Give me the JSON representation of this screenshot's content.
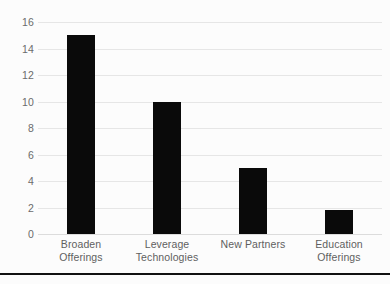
{
  "chart_data": {
    "type": "bar",
    "title": "",
    "subtitle": "",
    "xlabel": "",
    "ylabel": "",
    "categories": [
      "Broaden Offerings",
      "Leverage\nTechnologies",
      "New Partners",
      "Education\nOfferings"
    ],
    "values": [
      15,
      10,
      5,
      1.8
    ],
    "ylim": [
      0,
      16
    ],
    "ytick_step": 2,
    "ytick_labels": [
      "0",
      "2",
      "4",
      "6",
      "8",
      "10",
      "12",
      "14",
      "16"
    ],
    "ytick_values": [
      0,
      2,
      4,
      6,
      8,
      10,
      12,
      14,
      16
    ],
    "grid": true,
    "grid_axis": "y",
    "legend": false,
    "legend_position": "none",
    "bar_color": "#0a0a0a",
    "gridline_color": "#e6e6e6",
    "tick_label_color": "#6b6b6b",
    "background_color": "#fcfcfc"
  },
  "figure": {
    "bottom_rule_color": "#111111"
  }
}
